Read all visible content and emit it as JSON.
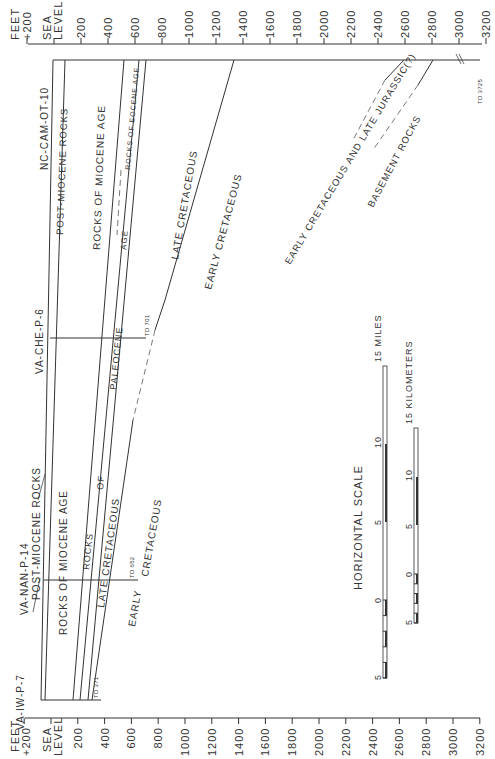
{
  "axes": {
    "unit_label": "FEET",
    "plus_label": "+200",
    "sea_level_label": [
      "SEA",
      "LEVEL"
    ],
    "tick_labels": [
      "200",
      "400",
      "600",
      "800",
      "1000",
      "1200",
      "1400",
      "1600",
      "1800",
      "2000",
      "2200",
      "2400",
      "2600",
      "2800",
      "3000",
      "3200"
    ]
  },
  "wells": [
    {
      "name": "NC-CAM-OT-10",
      "td": "TD 3725"
    },
    {
      "name": "VA-CHE-P-6",
      "td": "TD 701"
    },
    {
      "name": "VA-NAN-P-14",
      "td": "TD 652"
    },
    {
      "name": "VA-IW-P-7",
      "td": "TD 371"
    }
  ],
  "units": {
    "post_miocene_top": "POST-MIOCENE ROCKS",
    "post_miocene_bottom": "POST-MIOCENE ROCKS",
    "miocene_top": "ROCKS OF MIOCENE AGE",
    "miocene_bottom": "ROCKS OF MIOCENE AGE",
    "eocene": "ROCKS OF EOCENE AGE",
    "paleocene_age": "AGE",
    "paleocene": "PALEOCENE",
    "paleocene_of": "OF",
    "paleocene_rocks": "ROCKS",
    "late_cret_top": "LATE CRETACEOUS",
    "late_cret_bottom": "LATE CRETACEOUS",
    "early_cret_mid": "EARLY CRETACEOUS",
    "early_cret_bottom_1": "EARLY",
    "early_cret_bottom_2": "CRETACEOUS",
    "early_cret_jurassic": "EARLY CRETACEOUS AND LATE JURASSIC(?)",
    "basement": "BASEMENT ROCKS"
  },
  "scale": {
    "title": "HORIZONTAL SCALE",
    "miles_label": "MILES",
    "km_label": "KILOMETERS",
    "miles_ticks": [
      "5",
      "0",
      "5",
      "10",
      "15"
    ],
    "km_ticks": [
      "5",
      "0",
      "5",
      "10",
      "15"
    ]
  }
}
